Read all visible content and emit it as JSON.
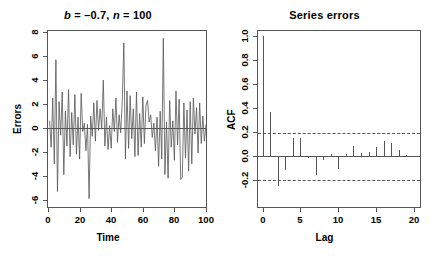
{
  "figure": {
    "background": "#ffffff",
    "axis_color": "#555555",
    "line_color": "#555555"
  },
  "panels": {
    "timeseries": {
      "title_prefix": "b",
      "title_mid": " = –0.7, ",
      "title_var2": "n",
      "title_suffix": " = 100",
      "title_plain": "b = –0.7, n = 100"
    },
    "acf": {
      "title": "Series errors"
    }
  },
  "chart_data": [
    {
      "type": "line",
      "title": "b = –0.7, n = 100",
      "xlabel": "Time",
      "ylabel": "Errors",
      "xlim": [
        0,
        100
      ],
      "ylim": [
        -6.6,
        8.1
      ],
      "xticks": [
        0,
        20,
        40,
        60,
        80,
        100
      ],
      "yticks": [
        -6,
        -4,
        -2,
        0,
        2,
        4,
        6,
        8
      ],
      "grid": false,
      "legend": "none",
      "reference_line_y": 0,
      "x": [
        1,
        2,
        3,
        4,
        5,
        6,
        7,
        8,
        9,
        10,
        11,
        12,
        13,
        14,
        15,
        16,
        17,
        18,
        19,
        20,
        21,
        22,
        23,
        24,
        25,
        26,
        27,
        28,
        29,
        30,
        31,
        32,
        33,
        34,
        35,
        36,
        37,
        38,
        39,
        40,
        41,
        42,
        43,
        44,
        45,
        46,
        47,
        48,
        49,
        50,
        51,
        52,
        53,
        54,
        55,
        56,
        57,
        58,
        59,
        60,
        61,
        62,
        63,
        64,
        65,
        66,
        67,
        68,
        69,
        70,
        71,
        72,
        73,
        74,
        75,
        76,
        77,
        78,
        79,
        80,
        81,
        82,
        83,
        84,
        85,
        86,
        87,
        88,
        89,
        90,
        91,
        92,
        93,
        94,
        95,
        96,
        97,
        98,
        99,
        100
      ],
      "values": [
        0.6,
        -1.6,
        2.5,
        -3.0,
        5.7,
        -5.3,
        2.2,
        -0.6,
        3.0,
        -3.9,
        1.4,
        -1.5,
        3.2,
        -2.4,
        1.3,
        -1.4,
        2.8,
        -2.2,
        0.9,
        -2.6,
        2.9,
        -0.3,
        0.4,
        -1.9,
        0.3,
        -5.9,
        1.0,
        -0.7,
        2.1,
        -1.1,
        2.3,
        -0.2,
        1.6,
        -0.1,
        4.0,
        -1.5,
        0.9,
        -1.8,
        0.2,
        -1.7,
        1.6,
        -0.3,
        2.5,
        -1.2,
        1.1,
        -0.4,
        2.2,
        7.1,
        -2.6,
        3.1,
        -1.7,
        2.7,
        -0.9,
        1.6,
        -2.4,
        3.0,
        -2.3,
        1.2,
        -1.6,
        2.6,
        -1.3,
        1.9,
        2.3,
        0.5,
        1.1,
        -0.8,
        0.4,
        -1.9,
        0.9,
        -3.2,
        1.4,
        -2.6,
        7.5,
        -3.9,
        0.5,
        -4.2,
        2.3,
        -1.6,
        0.6,
        -2.7,
        3.1,
        -1.4,
        2.4,
        -4.3,
        -4.1,
        2.1,
        -2.5,
        1.5,
        -3.6,
        2.2,
        -3.0,
        2.5,
        -0.5,
        1.7,
        -2.1,
        2.1,
        -1.3,
        1.0,
        -1.1,
        0.3
      ]
    },
    {
      "type": "bar",
      "title": "Series errors",
      "xlabel": "Lag",
      "ylabel": "ACF",
      "xlim": [
        -0.6,
        20.8
      ],
      "ylim": [
        -0.42,
        1.04
      ],
      "xticks": [
        0,
        5,
        10,
        15,
        20
      ],
      "yticks": [
        -0.2,
        0.0,
        0.2,
        0.4,
        0.6,
        0.8,
        1.0
      ],
      "ytick_labels": [
        "-0.2",
        "0.0",
        "0.2",
        "0.4",
        "0.6",
        "0.8",
        "1.0"
      ],
      "grid": false,
      "legend": "none",
      "reference_line_y": 0,
      "confidence_bounds": [
        0.196,
        -0.196
      ],
      "confidence_style": "dashed",
      "categories": [
        0,
        1,
        2,
        3,
        4,
        5,
        6,
        7,
        8,
        9,
        10,
        11,
        12,
        13,
        14,
        15,
        16,
        17,
        18,
        19,
        20
      ],
      "values": [
        1.0,
        0.37,
        -0.25,
        -0.12,
        0.15,
        0.15,
        -0.02,
        -0.16,
        -0.03,
        0.02,
        -0.11,
        0.02,
        0.09,
        0.03,
        0.04,
        0.08,
        0.13,
        0.11,
        0.05,
        0.01,
        0.0
      ]
    }
  ]
}
